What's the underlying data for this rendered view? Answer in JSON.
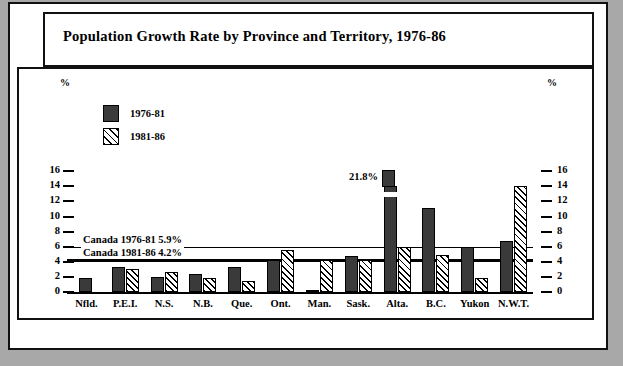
{
  "title": "Population Growth Rate by Province and Territory, 1976-86",
  "axis": {
    "unit_label": "%",
    "ticks": [
      0,
      2,
      4,
      6,
      8,
      10,
      12,
      14,
      16
    ],
    "ymin": 0,
    "ymax": 16
  },
  "legend": [
    {
      "label": "1976-81",
      "pattern": "solid-dark"
    },
    {
      "label": "1981-86",
      "pattern": "diagonal-hatch"
    }
  ],
  "reference_lines": [
    {
      "label": "Canada 1976-81  5.9%",
      "value": 5.9,
      "style": "thin"
    },
    {
      "label": "Canada 1981-86  4.2%",
      "value": 4.2,
      "style": "thick"
    }
  ],
  "annotations": [
    {
      "text": "21.8%",
      "category": "Alta.",
      "series": "1976-81"
    }
  ],
  "chart_data": {
    "type": "bar",
    "title": "Population Growth Rate by Province and Territory, 1976-86",
    "xlabel": "",
    "ylabel": "%",
    "ylim": [
      0,
      16
    ],
    "grid": false,
    "legend_position": "inside-top-left",
    "categories": [
      "Nfld.",
      "P.E.I.",
      "N.S.",
      "N.B.",
      "Que.",
      "Ont.",
      "Man.",
      "Sask.",
      "Alta.",
      "B.C.",
      "Yukon",
      "N.W.T."
    ],
    "series": [
      {
        "name": "1976-81",
        "values": [
          1.8,
          3.3,
          2.0,
          2.4,
          3.3,
          4.2,
          0.3,
          4.8,
          21.8,
          11.1,
          5.9,
          6.7
        ],
        "clipped": [
          false,
          false,
          false,
          false,
          false,
          false,
          false,
          false,
          true,
          false,
          false,
          false
        ]
      },
      {
        "name": "1981-86",
        "values": [
          0.0,
          3.1,
          2.7,
          1.8,
          1.4,
          5.6,
          4.2,
          4.2,
          5.9,
          4.9,
          1.8,
          14.0
        ],
        "clipped": [
          false,
          false,
          false,
          false,
          false,
          false,
          false,
          false,
          false,
          false,
          false,
          false
        ]
      }
    ],
    "reference_lines": [
      {
        "name": "Canada 1976-81",
        "value": 5.9
      },
      {
        "name": "Canada 1981-86",
        "value": 4.2
      }
    ],
    "annotations": [
      {
        "text": "21.8%",
        "category": "Alta.",
        "series": "1976-81",
        "note": "bar drawn broken/truncated at top of axis"
      }
    ]
  }
}
